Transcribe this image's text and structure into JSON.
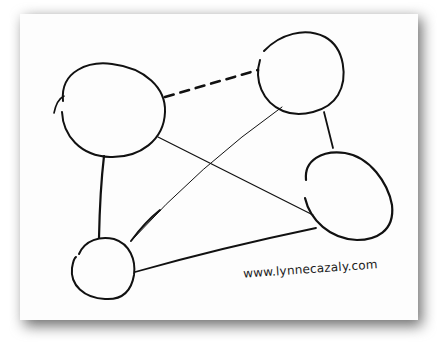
{
  "diagram": {
    "type": "hand-drawn network diagram",
    "nodes": [
      {
        "id": "A",
        "label": "",
        "position": "top-left"
      },
      {
        "id": "B",
        "label": "",
        "position": "top-right"
      },
      {
        "id": "C",
        "label": "",
        "position": "right"
      },
      {
        "id": "D",
        "label": "",
        "position": "bottom-left"
      }
    ],
    "edges": [
      {
        "from": "A",
        "to": "B",
        "style": "dashed-thick"
      },
      {
        "from": "A",
        "to": "D",
        "style": "solid-thick"
      },
      {
        "from": "A",
        "to": "C",
        "style": "solid-thin"
      },
      {
        "from": "B",
        "to": "C",
        "style": "solid-thick"
      },
      {
        "from": "B",
        "to": "D",
        "style": "solid-thin"
      },
      {
        "from": "C",
        "to": "D",
        "style": "solid-medium"
      }
    ],
    "credit": "www.lynnecazaly.com"
  },
  "colors": {
    "ink": "#111111",
    "paper": "#fdfdfd",
    "shadow": "#6f6f6f"
  }
}
